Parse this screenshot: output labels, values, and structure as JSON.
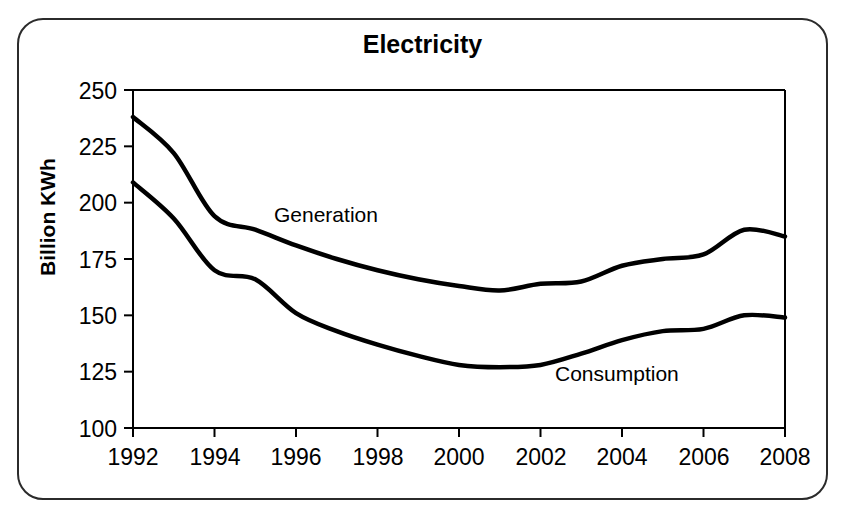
{
  "figure": {
    "border_color": "#2b2b2b",
    "background": "#ffffff"
  },
  "title": "Electricity",
  "axis": {
    "y_title": "Billion KWh",
    "y_ticks": [
      "250",
      "225",
      "200",
      "175",
      "150",
      "125",
      "100"
    ],
    "x_ticks": [
      "1992",
      "1994",
      "1996",
      "1998",
      "2000",
      "2002",
      "2004",
      "2006",
      "2008"
    ]
  },
  "labels": {
    "generation": "Generation",
    "consumption": "Consumption"
  },
  "chart_data": {
    "type": "line",
    "title": "Electricity",
    "xlabel": "",
    "ylabel": "Billion KWh",
    "xlim": [
      1992,
      2008
    ],
    "ylim": [
      100,
      250
    ],
    "ytick_step": 25,
    "xtick_step": 2,
    "grid": false,
    "legend": "inline-annotation",
    "line_color": "#000000",
    "line_width": 4,
    "x": [
      1992,
      1993,
      1994,
      1995,
      1996,
      1997,
      1998,
      1999,
      2000,
      2001,
      2002,
      2003,
      2004,
      2005,
      2006,
      2007,
      2008
    ],
    "series": [
      {
        "name": "Generation",
        "values": [
          238,
          222,
          194,
          188,
          181,
          175,
          170,
          166,
          163,
          161,
          164,
          165,
          172,
          175,
          177,
          188,
          185
        ]
      },
      {
        "name": "Consumption",
        "values": [
          209,
          193,
          170,
          166,
          151,
          143,
          137,
          132,
          128,
          127,
          128,
          133,
          139,
          143,
          144,
          150,
          149
        ]
      }
    ],
    "annotations": [
      {
        "text": "Generation",
        "x": 1996.2,
        "y": 196
      },
      {
        "text": "Consumption",
        "x": 2002.1,
        "y": 119
      }
    ]
  }
}
